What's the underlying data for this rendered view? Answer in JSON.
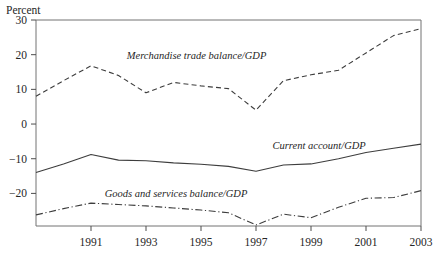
{
  "chart_data": {
    "type": "line",
    "title": "",
    "xlabel": "",
    "ylabel": "Percent",
    "ylim": [
      -29.4,
      30
    ],
    "xlim": [
      1989,
      2003
    ],
    "grid": false,
    "legend_position": "inline-annotations",
    "yticks": [
      30,
      20,
      10,
      0,
      -10,
      -20
    ],
    "ytick_labels": [
      "30",
      "20",
      "10",
      "0",
      "−10",
      "−20"
    ],
    "xticks": [
      1991,
      1993,
      1995,
      1997,
      1999,
      2001,
      2003
    ],
    "xtick_labels": [
      "1991",
      "1993",
      "1995",
      "1997",
      "1999",
      "2001",
      "2003"
    ],
    "x": [
      1989,
      1990,
      1991,
      1992,
      1993,
      1994,
      1995,
      1996,
      1997,
      1998,
      1999,
      2000,
      2001,
      2002,
      2003
    ],
    "series": [
      {
        "name": "Merchandise trade balance/GDP",
        "style": "dashed",
        "color": "#3d3d3d",
        "values": [
          8.0,
          12.5,
          16.8,
          14.0,
          9.0,
          12.0,
          11.0,
          10.2,
          4.0,
          12.5,
          14.2,
          15.5,
          20.5,
          25.5,
          27.5
        ],
        "label_x": 1992.3,
        "label_y": 18.8
      },
      {
        "name": "Current account/GDP",
        "style": "solid",
        "color": "#3d3d3d",
        "values": [
          -14.0,
          -11.5,
          -8.8,
          -10.4,
          -10.6,
          -11.2,
          -11.6,
          -12.2,
          -13.6,
          -11.8,
          -11.5,
          -10.0,
          -8.2,
          -7.0,
          -5.8
        ],
        "label_x": 1997.6,
        "label_y": -7.3
      },
      {
        "name": "Goods and services balance/GDP",
        "style": "dashdot",
        "color": "#3d3d3d",
        "values": [
          -26.2,
          -24.4,
          -22.8,
          -23.2,
          -23.6,
          -24.2,
          -24.8,
          -25.6,
          -29.1,
          -26.0,
          -27.0,
          -24.0,
          -21.4,
          -21.2,
          -19.2
        ],
        "label_x": 1991.5,
        "label_y": -20.9
      }
    ]
  }
}
